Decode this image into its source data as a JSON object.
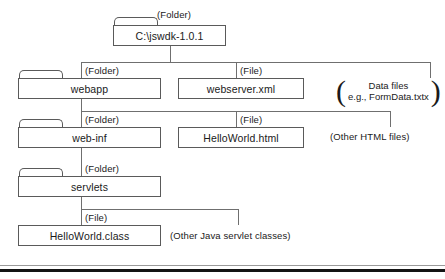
{
  "diagram": {
    "root": {
      "tag": "(Folder)",
      "label": "C:\\jswdk-1.0.1"
    },
    "level2": {
      "webapp": {
        "tag": "(Folder)",
        "label": "webapp"
      },
      "webserver": {
        "tag": "(File)",
        "label": "webserver.xml"
      },
      "data_note_line1": "Data files",
      "data_note_line2": "e.g., FormData.txtx",
      "paren_open": "(",
      "paren_close": ")"
    },
    "level3": {
      "webinf": {
        "tag": "(Folder)",
        "label": "web-inf"
      },
      "helloworld_html": {
        "tag": "(File)",
        "label": "HelloWorld.html"
      },
      "other_html_note": "(Other HTML files)"
    },
    "level4": {
      "servlets": {
        "tag": "(Folder)",
        "label": "servlets"
      }
    },
    "level5": {
      "helloworld_class": {
        "tag": "(File)",
        "label": "HelloWorld.class"
      },
      "other_servlets_note": "(Other Java servlet classes)"
    },
    "colors": {
      "line": "#6f6f6f",
      "box_border": "#5a5a5a",
      "text": "#1a1a1a",
      "rule": "#141414",
      "background": "#ffffff"
    }
  }
}
